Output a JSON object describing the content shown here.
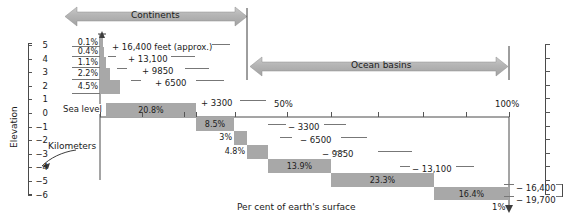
{
  "figure": {
    "title_top": "Continents",
    "title_ocean": "Ocean basins",
    "xlabel": "Per cent of earth's surface",
    "ylabel": "Elevation",
    "unit_note": "Kilometers",
    "sea_level_label": "Sea level",
    "one_percent_label": "1%"
  },
  "chart_data": {
    "type": "bar",
    "xlabel": "Per cent of earth's surface",
    "ylabel": "Elevation (Kilometers)",
    "xlim": [
      0,
      100
    ],
    "ylim": [
      -6,
      5
    ],
    "grid": false,
    "legend": [
      "Continents",
      "Ocean basins"
    ],
    "x_ticks": [
      "50%",
      "100%"
    ],
    "y_ticks_km": [
      "5",
      "4",
      "3",
      "2",
      "1",
      "0",
      "-1",
      "-2",
      "-3",
      "-4",
      "-5",
      "-6"
    ],
    "categories": [
      "0.1%",
      "0.4%",
      "1.1%",
      "2.2%",
      "4.5%",
      "20.8%",
      "8.5%",
      "3%",
      "4.8%",
      "13.9%",
      "23.3%",
      "16.4%",
      "1%"
    ],
    "values": [
      0.1,
      0.4,
      1.1,
      2.2,
      4.5,
      20.8,
      8.5,
      3,
      4.8,
      13.9,
      23.3,
      16.4,
      1
    ],
    "elevation_bands_km": [
      [
        4,
        5
      ],
      [
        3,
        4
      ],
      [
        2,
        3
      ],
      [
        1,
        2
      ],
      [
        0,
        1
      ],
      [
        -1,
        0
      ],
      [
        -2,
        -1
      ],
      [
        -3,
        -2
      ],
      [
        -4,
        -3
      ],
      [
        -5,
        -4
      ],
      [
        -6,
        -5
      ],
      [
        -6.5,
        -6
      ]
    ],
    "feet_annotations": [
      "+16,400 feet (approx.)",
      "+13,100",
      "+9850",
      "+6500",
      "+3300",
      "-3300",
      "-6500",
      "-9850",
      "-13,100",
      "-16,400",
      "-19,700"
    ]
  },
  "bars": [
    {
      "label": "0.1%",
      "x": 100.0,
      "y": 38.0,
      "w": 3.0,
      "h": 9.0,
      "label_pos": "left"
    },
    {
      "label": "0.4%",
      "x": 100.0,
      "y": 47.0,
      "w": 4.0,
      "h": 10.0,
      "label_pos": "left"
    },
    {
      "label": "1.1%",
      "x": 100.0,
      "y": 57.0,
      "w": 6.0,
      "h": 11.0,
      "label_pos": "left"
    },
    {
      "label": "2.2%",
      "x": 100.0,
      "y": 68.0,
      "w": 10.0,
      "h": 12.0,
      "label_pos": "left"
    },
    {
      "label": "4.5%",
      "x": 100.0,
      "y": 80.0,
      "w": 20.0,
      "h": 14.0,
      "label_pos": "left"
    },
    {
      "label": "20.8%",
      "x": 106.0,
      "y": 103.0,
      "w": 90.0,
      "h": 14.0,
      "label_pos": "in"
    },
    {
      "label": "8.5%",
      "x": 196.0,
      "y": 117.0,
      "w": 38.0,
      "h": 14.0,
      "label_pos": "in"
    },
    {
      "label": "3%",
      "x": 234.0,
      "y": 131.0,
      "w": 13.0,
      "h": 14.0,
      "label_pos": "left"
    },
    {
      "label": "4.8%",
      "x": 247.0,
      "y": 145.0,
      "w": 21.0,
      "h": 14.0,
      "label_pos": "left"
    },
    {
      "label": "13.9%",
      "x": 268.0,
      "y": 159.0,
      "w": 63.0,
      "h": 14.0,
      "label_pos": "in"
    },
    {
      "label": "23.3%",
      "x": 331.0,
      "y": 173.0,
      "w": 103.0,
      "h": 14.0,
      "label_pos": "in"
    },
    {
      "label": "16.4%",
      "x": 434.0,
      "y": 187.0,
      "w": 75.0,
      "h": 13.0,
      "label_pos": "in"
    }
  ],
  "y_axis_left": {
    "label": "Elevation",
    "ticks": [
      "5",
      "4",
      "3",
      "2",
      "1",
      "0",
      "-1",
      "-2",
      "-3",
      "-4",
      "-5",
      "-6"
    ]
  },
  "feet_labels": [
    {
      "text": "+16,400 feet (approx.)",
      "x": 112,
      "y": 43
    },
    {
      "text": "+13,100",
      "x": 128,
      "y": 55
    },
    {
      "text": "+9850",
      "x": 142,
      "y": 67
    },
    {
      "text": "+6500",
      "x": 155,
      "y": 79
    },
    {
      "text": "+3300",
      "x": 201,
      "y": 99
    },
    {
      "text": "-3300",
      "x": 288,
      "y": 123
    },
    {
      "text": "-6500",
      "x": 300,
      "y": 136
    },
    {
      "text": "-9850",
      "x": 322,
      "y": 150
    },
    {
      "text": "-13,100",
      "x": 412,
      "y": 165
    },
    {
      "text": "-16,400",
      "x": 516,
      "y": 184
    },
    {
      "text": "-19,700",
      "x": 516,
      "y": 196
    }
  ],
  "x_axis": {
    "ticks": [
      {
        "label": "50%",
        "x": 287
      },
      {
        "label": "100%",
        "x": 509
      }
    ]
  }
}
